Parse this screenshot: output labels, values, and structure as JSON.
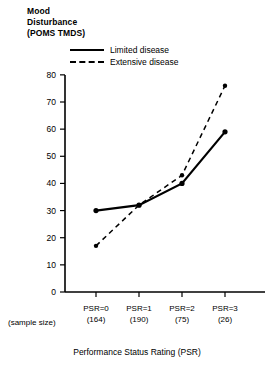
{
  "chart_data": {
    "type": "line",
    "title": "",
    "ylabel": "Mood Disturbance (POMS TMDS)",
    "ylabel_lines": [
      "Mood",
      "Disturbance",
      "(POMS TMDS)"
    ],
    "xlabel": "Performance Status Rating (PSR)",
    "categories": [
      "PSR=0",
      "PSR=1",
      "PSR=2",
      "PSR=3"
    ],
    "sample_sizes": [
      "(164)",
      "(190)",
      "(75)",
      "(26)"
    ],
    "sample_size_label": "(sample size)",
    "ylim": [
      0,
      85
    ],
    "yticks": [
      0,
      10,
      20,
      30,
      40,
      50,
      60,
      70,
      80
    ],
    "ytick_labels": [
      "0",
      "10",
      "20",
      "30",
      "40",
      "50",
      "60",
      "70",
      "80"
    ],
    "grid": false,
    "legend_position": "top-left-inside",
    "series": [
      {
        "name": "Limited disease",
        "style": "solid",
        "color": "#000000",
        "marker": "filled-circle",
        "values": [
          30,
          32,
          40,
          59
        ]
      },
      {
        "name": "Extensive disease",
        "style": "dashed",
        "color": "#000000",
        "marker": "filled-circle",
        "values": [
          17,
          32,
          43,
          76
        ]
      }
    ]
  },
  "legend": {
    "items": [
      {
        "label": "Limited disease",
        "style": "solid"
      },
      {
        "label": "Extensive disease",
        "style": "dashed"
      }
    ]
  },
  "axis": {
    "y_label_line1": "Mood",
    "y_label_line2": "Disturbance",
    "y_label_line3": "(POMS TMDS)",
    "x_title": "Performance Status Rating (PSR)",
    "sample_size_caption": "(sample size)"
  },
  "colors": {
    "ink": "#000000",
    "background": "#ffffff"
  }
}
